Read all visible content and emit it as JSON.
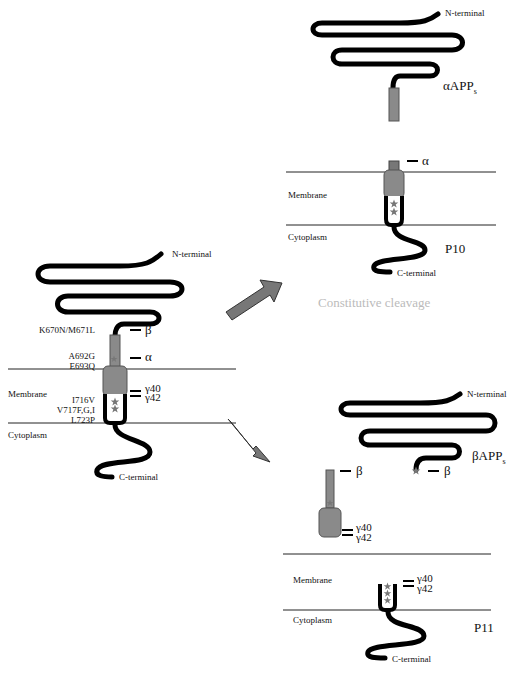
{
  "figure": {
    "colors": {
      "chain": "#000000",
      "domain": "#8a8a8a",
      "arrow": "#777777",
      "caption": "#bbbbbb",
      "membrane_line": "#222222"
    }
  },
  "full_length": {
    "n_terminal": "N-terminal",
    "c_terminal": "C-terminal",
    "membrane": "Membrane",
    "cytoplasm": "Cytoplasm",
    "mutations": {
      "beta_site": "K670N/M671L",
      "alpha_site_1": "A692G",
      "alpha_site_2": "E693Q",
      "gamma_site_1": "I716V",
      "gamma_site_2": "V717F,G,I",
      "gamma_site_3": "L723P"
    },
    "cleavage": {
      "beta": "β",
      "alpha": "α",
      "gamma40": "γ40",
      "gamma42": "γ42"
    }
  },
  "alpha_path": {
    "caption": "Constitutive cleavage",
    "secreted": {
      "n_terminal": "N-terminal",
      "name": "αAPP",
      "subscript": "s"
    },
    "fragment": {
      "alpha": "α",
      "membrane": "Membrane",
      "cytoplasm": "Cytoplasm",
      "name": "P10",
      "c_terminal": "C-terminal"
    }
  },
  "beta_path": {
    "secreted": {
      "n_terminal": "N-terminal",
      "name": "βAPP",
      "subscript": "s",
      "beta": "β"
    },
    "abeta": {
      "beta": "β",
      "gamma40": "γ40",
      "gamma42": "γ42"
    },
    "fragment": {
      "gamma40": "γ40",
      "gamma42": "γ42",
      "membrane": "Membrane",
      "cytoplasm": "Cytoplasm",
      "name": "P11",
      "c_terminal": "C-terminal"
    }
  }
}
